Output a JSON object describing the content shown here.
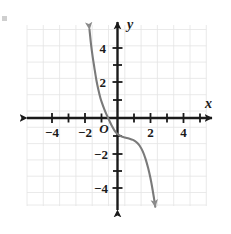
{
  "chart_data": {
    "type": "line",
    "title": "",
    "xlabel": "x",
    "ylabel": "y",
    "xlim": [
      -5.6,
      5.6
    ],
    "ylim": [
      -5.4,
      5.4
    ],
    "grid": true,
    "grid_step": 1,
    "legend": "none",
    "origin_label": "O",
    "x_ticks": [
      -4,
      -2,
      2,
      4
    ],
    "x_tick_labels": [
      "−4",
      "−2",
      "2",
      "4"
    ],
    "y_ticks": [
      4,
      2,
      -2,
      -4
    ],
    "y_tick_labels": [
      "4",
      "2",
      "−2",
      "−4"
    ],
    "x_minor_ticks": [
      -5,
      -4,
      -3,
      -2,
      -1,
      1,
      2,
      3,
      4,
      5
    ],
    "y_minor_ticks": [
      5,
      4,
      3,
      2,
      1,
      -1,
      -2,
      -3,
      -4,
      -5
    ],
    "series": [
      {
        "name": "cubic",
        "arrow_start": "up",
        "arrow_end": "down",
        "points": [
          [
            -1.72,
            5.1
          ],
          [
            -1.62,
            4.2
          ],
          [
            -1.52,
            3.5
          ],
          [
            -1.42,
            2.9
          ],
          [
            -1.3,
            2.2
          ],
          [
            -1.18,
            1.65
          ],
          [
            -1.05,
            1.15
          ],
          [
            -0.92,
            0.78
          ],
          [
            -0.8,
            0.48
          ],
          [
            -0.65,
            0.15
          ],
          [
            -0.5,
            -0.15
          ],
          [
            -0.35,
            -0.45
          ],
          [
            -0.18,
            -0.72
          ],
          [
            0.0,
            -0.92
          ],
          [
            0.22,
            -1.05
          ],
          [
            0.45,
            -1.12
          ],
          [
            0.7,
            -1.18
          ],
          [
            0.95,
            -1.26
          ],
          [
            1.15,
            -1.38
          ],
          [
            1.35,
            -1.58
          ],
          [
            1.55,
            -1.92
          ],
          [
            1.72,
            -2.35
          ],
          [
            1.88,
            -2.88
          ],
          [
            2.02,
            -3.45
          ],
          [
            2.14,
            -4.05
          ],
          [
            2.24,
            -4.62
          ],
          [
            2.32,
            -5.1
          ]
        ]
      }
    ],
    "colors": {
      "curve": "#6b6b6b",
      "axis": "#1a1a1a",
      "grid": "#e2e2e2",
      "background": "#ffffff"
    }
  },
  "axes": {
    "x_axis_label": "x",
    "y_axis_label": "y",
    "origin": "O"
  },
  "ticks": {
    "x": [
      "−4",
      "−2",
      "2",
      "4"
    ],
    "y": [
      "4",
      "2",
      "−2",
      "−4"
    ]
  }
}
